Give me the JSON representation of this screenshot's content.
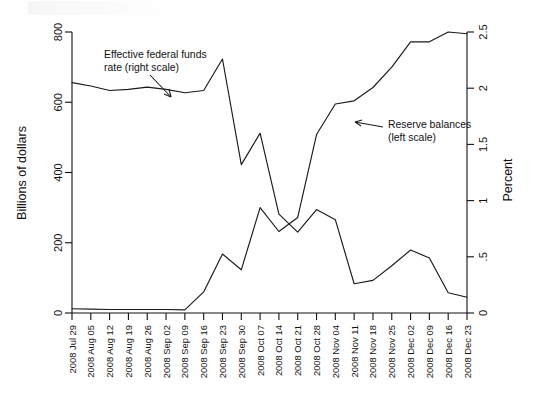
{
  "chart_data": {
    "type": "line",
    "title": "",
    "subtitle": "",
    "xlabel": "",
    "ylabel": "Billions of dollars",
    "y2label": "Percent",
    "grid": false,
    "legend_position": "inline-annotations",
    "ylim": [
      0,
      800
    ],
    "y2lim": [
      0,
      2.5
    ],
    "yticks": [
      "0",
      "200",
      "400",
      "600",
      "800"
    ],
    "ytick_values": [
      0,
      200,
      400,
      600,
      800
    ],
    "y2ticks": [
      "0",
      ".5",
      "1",
      "1.5",
      "2",
      "2.5"
    ],
    "y2tick_values": [
      0,
      0.5,
      1,
      1.5,
      2,
      2.5
    ],
    "categories": [
      "2008 Jul 29",
      "2008 Aug 05",
      "2008 Aug 12",
      "2008 Aug 19",
      "2008 Aug 26",
      "2008 Sep 02",
      "2008 Sep 09",
      "2008 Sep 16",
      "2008 Sep 23",
      "2008 Sep 30",
      "2008 Oct 07",
      "2008 Oct 14",
      "2008 Oct 21",
      "2008 Oct 28",
      "2008 Nov 04",
      "2008 Nov 11",
      "2008 Nov 18",
      "2008 Nov 25",
      "2008 Dec 02",
      "2008 Dec 09",
      "2008 Dec 16",
      "2008 Dec 23"
    ],
    "xtick_labels_shown": [
      "2008 Jul 29",
      "2008 Aug 05",
      "2008 Aug 12",
      "2008 Aug 19",
      "2008 Aug 26",
      "2008 Sep 02",
      "2008 Sep 09",
      "2008 Sep 16",
      "2008 Sep 23",
      "2008 Sep 30",
      "2008 Oct 07",
      "2008 Oct 14",
      "2008 Oct 21",
      "2008 Oct 28",
      "2008 Nov 04",
      "2008 Nov 11",
      "2008 Nov 18",
      "2008 Nov 25",
      "2008 Dec 02",
      "2008 Dec 09",
      "2008 Dec 16",
      "2008 Dec 23"
    ],
    "series": [
      {
        "name": "Reserve balances (left scale)",
        "axis": "left",
        "units": "Billions of dollars",
        "values": [
          12,
          11,
          10,
          10,
          10,
          10,
          9,
          60,
          168,
          123,
          300,
          232,
          272,
          508,
          595,
          604,
          642,
          700,
          772,
          772,
          800,
          795
        ]
      },
      {
        "name": "Effective federal funds rate (right scale)",
        "axis": "right",
        "units": "Percent",
        "values": [
          2.05,
          2.02,
          1.98,
          1.99,
          2.01,
          1.99,
          1.96,
          1.98,
          2.26,
          1.32,
          1.6,
          0.88,
          0.72,
          0.92,
          0.83,
          0.26,
          0.29,
          0.42,
          0.56,
          0.49,
          0.18,
          0.14
        ]
      }
    ],
    "annotations": [
      {
        "id": "ffr-annotation",
        "line1": "Effective federal funds",
        "line2": "rate (right scale)"
      },
      {
        "id": "reserves-annotation",
        "line1": "Reserve balances",
        "line2": "(left scale)"
      }
    ]
  }
}
